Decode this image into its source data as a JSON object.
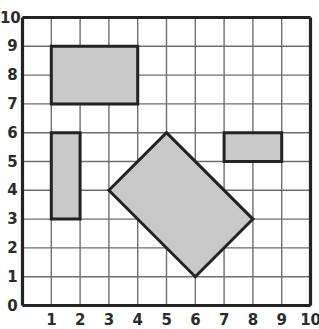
{
  "chart_data": {
    "type": "scatter",
    "title": "",
    "xlabel": "",
    "ylabel": "",
    "xlim": [
      0,
      10
    ],
    "ylim": [
      0,
      10
    ],
    "grid": true,
    "grid_step": 1,
    "legend": "none",
    "x_ticks": [
      "0",
      "1",
      "2",
      "3",
      "4",
      "5",
      "6",
      "7",
      "8",
      "9",
      "10"
    ],
    "y_ticks": [
      "0",
      "1",
      "2",
      "3",
      "4",
      "5",
      "6",
      "7",
      "8",
      "9",
      "10"
    ],
    "shapes": [
      {
        "name": "large-rectangle",
        "kind": "rectangle",
        "vertices": [
          [
            1,
            9
          ],
          [
            4,
            9
          ],
          [
            4,
            7
          ],
          [
            1,
            7
          ]
        ],
        "width": 3,
        "height": 2,
        "area": 6,
        "perimeter": 10,
        "fill": "#c9c9c9",
        "stroke": "#232323"
      },
      {
        "name": "tall-thin-rectangle",
        "kind": "rectangle",
        "vertices": [
          [
            1,
            6
          ],
          [
            2,
            6
          ],
          [
            2,
            3
          ],
          [
            1,
            3
          ]
        ],
        "width": 1,
        "height": 3,
        "area": 3,
        "perimeter": 8,
        "fill": "#c9c9c9",
        "stroke": "#232323"
      },
      {
        "name": "small-wide-rectangle",
        "kind": "rectangle",
        "vertices": [
          [
            7,
            6
          ],
          [
            9,
            6
          ],
          [
            9,
            5
          ],
          [
            7,
            5
          ]
        ],
        "width": 2,
        "height": 1,
        "area": 2,
        "perimeter": 6,
        "fill": "#c9c9c9",
        "stroke": "#232323"
      },
      {
        "name": "rotated-rectangle",
        "kind": "rotated-rectangle",
        "vertices": [
          [
            3,
            4
          ],
          [
            5,
            6
          ],
          [
            8,
            3
          ],
          [
            6,
            1
          ]
        ],
        "fill": "#c9c9c9",
        "stroke": "#232323"
      }
    ]
  },
  "axes": {
    "x_tick_labels": [
      "0",
      "1",
      "2",
      "3",
      "4",
      "5",
      "6",
      "7",
      "8",
      "9",
      "10"
    ],
    "y_tick_labels": [
      "0",
      "1",
      "2",
      "3",
      "4",
      "5",
      "6",
      "7",
      "8",
      "9",
      "10"
    ]
  },
  "colors": {
    "shape_fill": "#c9c9c9",
    "shape_stroke": "#232323",
    "grid_line": "#6e6e6e",
    "axis_line": "#232323",
    "label_text": "#2b2b2b",
    "background": "#ffffff"
  }
}
